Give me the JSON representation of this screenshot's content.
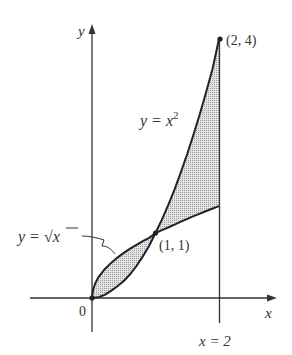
{
  "diagram": {
    "type": "area-between-curves",
    "axes": {
      "x_label": "x",
      "y_label": "y",
      "origin_label": "0"
    },
    "curves": [
      {
        "name": "parabola",
        "label_lhs": "y = ",
        "label_var": "x",
        "label_exp": "2"
      },
      {
        "name": "sqrt",
        "label_lhs": "y = ",
        "label_sqrt": "√",
        "label_var": "x"
      }
    ],
    "points": [
      {
        "label": "(2, 4)",
        "x": 2,
        "y": 4
      },
      {
        "label": "(1, 1)",
        "x": 1,
        "y": 1
      },
      {
        "label": "",
        "x": 0,
        "y": 0
      }
    ],
    "vertical_line": {
      "label": "x = 2",
      "x": 2
    },
    "shading_color": "#c8c8c8",
    "line_color": "#222222"
  }
}
